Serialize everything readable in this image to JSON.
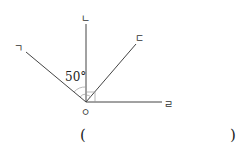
{
  "diagram": {
    "vertex_label": "ㅇ",
    "rays": [
      {
        "label": "ㄱ"
      },
      {
        "label": "ㄴ"
      },
      {
        "label": "ㄷ"
      },
      {
        "label": "ㄹ"
      }
    ],
    "angle_label": "50°"
  },
  "answer": {
    "open": "(",
    "close": ")"
  }
}
